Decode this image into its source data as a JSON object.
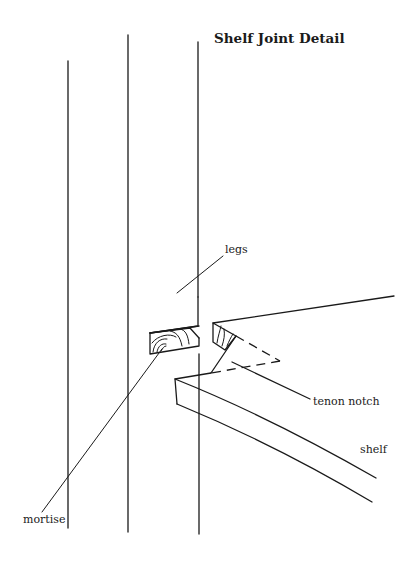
{
  "title": "Shelf Joint Detail",
  "labels": {
    "legs": "legs",
    "tenon_notch": "tenon notch",
    "shelf": "shelf",
    "mortise": "mortise"
  },
  "colors": {
    "ink": "#1a1a1a",
    "background": "#ffffff"
  }
}
